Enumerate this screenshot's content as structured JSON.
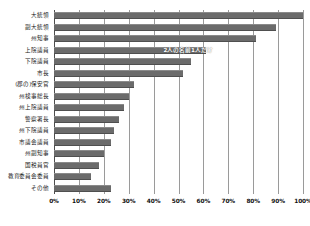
{
  "chart_data": {
    "type": "bar",
    "orientation": "horizontal",
    "title": "",
    "xlabel": "",
    "ylabel": "",
    "xlim": [
      0,
      100
    ],
    "grid": true,
    "legend": null,
    "bar_color": "#6b6b6b",
    "categories": [
      "大統領",
      "副大統領",
      "州知事",
      "上院議員",
      "下院議員",
      "市長",
      "(郡の)保安官",
      "州検事総長",
      "州上院議員",
      "警察署長",
      "州下院議員",
      "市議会議員",
      "州副知事",
      "国税員官",
      "教育委員会委員",
      "その他"
    ],
    "values": [
      100,
      89,
      81,
      61,
      55,
      52,
      32,
      30,
      28,
      26,
      24,
      23,
      20,
      18,
      15,
      23
    ],
    "xticks": [
      0,
      10,
      20,
      30,
      40,
      50,
      60,
      70,
      80,
      90,
      100
    ],
    "xticklabels": [
      "0%",
      "10%",
      "20%",
      "30%",
      "40%",
      "50%",
      "60%",
      "70%",
      "80%",
      "90%",
      "100%"
    ],
    "annotations": [
      {
        "text": "2人の名前",
        "row": 3,
        "x": 44
      },
      {
        "text": "1人だけ",
        "row": 3,
        "x": 55
      }
    ]
  }
}
